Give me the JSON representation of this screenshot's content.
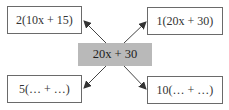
{
  "diagram": {
    "center": {
      "label": "20x + 30",
      "fill": "#b9b9b9"
    },
    "nodes": [
      {
        "id": "top-left",
        "label": "2(10x + 15)"
      },
      {
        "id": "top-right",
        "label": "1(20x + 30)"
      },
      {
        "id": "bottom-left",
        "label": "5(… + …)"
      },
      {
        "id": "bottom-right",
        "label": "10(… + …)"
      }
    ],
    "edges": [
      {
        "from": "center",
        "to": "top-left"
      },
      {
        "from": "center",
        "to": "top-right"
      },
      {
        "from": "center",
        "to": "bottom-left"
      },
      {
        "from": "center",
        "to": "bottom-right"
      }
    ]
  }
}
